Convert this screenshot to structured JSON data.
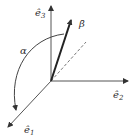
{
  "diagram": {
    "type": "3d-coordinate-vector",
    "axes": [
      {
        "id": "e1",
        "label": "ê",
        "subscript": "1"
      },
      {
        "id": "e2",
        "label": "ê",
        "subscript": "2"
      },
      {
        "id": "e3",
        "label": "ê",
        "subscript": "3"
      }
    ],
    "vector": {
      "label": "β̄"
    },
    "angle": {
      "label": "α"
    },
    "colors": {
      "stroke": "#333333",
      "dashed": "#666666",
      "background": "#ffffff"
    }
  }
}
